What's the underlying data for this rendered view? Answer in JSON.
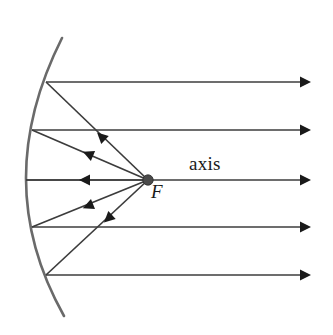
{
  "figure": {
    "kind": "optics-ray-diagram",
    "background_color": "#ffffff"
  },
  "labels": {
    "axis": "axis",
    "focal_point": "F"
  },
  "colors": {
    "mirror": "#6a6a6a",
    "ray": "#3c3c3c",
    "arrowhead": "#1a1a1a",
    "focal_dot": "#4a4a4a",
    "text": "#1a1a1a"
  },
  "geometry": {
    "canvas": {
      "width": 333,
      "height": 335
    },
    "mirror": {
      "vertex": {
        "x": 26,
        "y": 180
      },
      "top_end": {
        "x": 62,
        "y": 38
      },
      "bottom_end": {
        "x": 64,
        "y": 316
      },
      "stroke_width": 2.6
    },
    "focal_point": {
      "x": 148,
      "y": 180,
      "radius": 5.2
    },
    "incoming_rays": [
      {
        "id": "ray-1",
        "y": 82,
        "x_start": 46,
        "x_end": 306
      },
      {
        "id": "ray-2",
        "y": 130,
        "x_start": 32,
        "x_end": 306
      },
      {
        "id": "ray-3",
        "y": 180,
        "x_start": 26,
        "x_end": 306
      },
      {
        "id": "ray-4",
        "y": 227,
        "x_start": 32,
        "x_end": 306
      },
      {
        "id": "ray-5",
        "y": 275,
        "x_start": 46,
        "x_end": 306
      }
    ],
    "reflected_rays": [
      {
        "id": "reflected-1",
        "from": {
          "x": 148,
          "y": 180
        },
        "to": {
          "x": 46,
          "y": 82
        },
        "arrow_at": {
          "x": 105,
          "y": 140
        }
      },
      {
        "id": "reflected-2",
        "from": {
          "x": 148,
          "y": 180
        },
        "to": {
          "x": 32,
          "y": 130
        },
        "arrow_at": {
          "x": 93,
          "y": 156
        }
      },
      {
        "id": "reflected-3",
        "from": {
          "x": 148,
          "y": 180
        },
        "to": {
          "x": 26,
          "y": 180
        },
        "arrow_at": {
          "x": 90,
          "y": 180
        }
      },
      {
        "id": "reflected-4",
        "from": {
          "x": 148,
          "y": 180
        },
        "to": {
          "x": 32,
          "y": 227
        },
        "arrow_at": {
          "x": 93,
          "y": 204
        }
      },
      {
        "id": "reflected-5",
        "from": {
          "x": 148,
          "y": 180
        },
        "to": {
          "x": 46,
          "y": 275
        },
        "arrow_at": {
          "x": 112,
          "y": 215
        }
      }
    ]
  }
}
